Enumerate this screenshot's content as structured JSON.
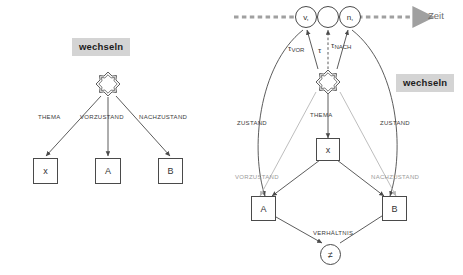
{
  "figure": {
    "title_badges": [
      {
        "id": "left",
        "label": "wechseln"
      },
      {
        "id": "right",
        "label": "wechseln"
      }
    ],
    "timeline": {
      "axis_label": "Zeit",
      "style": "dashed-arrow",
      "color": "#a0a0a0",
      "circles": [
        {
          "id": "vor",
          "label": "v,"
        },
        {
          "id": "mid",
          "label": ""
        },
        {
          "id": "nach",
          "label": "n,"
        }
      ],
      "time_edges": [
        {
          "base": "τ",
          "sub": "VOR"
        },
        {
          "base": "τ",
          "sub": ""
        },
        {
          "base": "τ",
          "sub": "NACH"
        }
      ]
    },
    "left_diagram": {
      "root": {
        "type": "star-node",
        "name": "wechseln"
      },
      "edges": [
        {
          "label": "THEMA",
          "target": "x"
        },
        {
          "label": "VORZUSTAND",
          "target": "A"
        },
        {
          "label": "NACHZUSTAND",
          "target": "B"
        }
      ],
      "nodes": [
        {
          "id": "x",
          "label": "x",
          "shape": "box"
        },
        {
          "id": "A",
          "label": "A",
          "shape": "box"
        },
        {
          "id": "B",
          "label": "B",
          "shape": "box"
        }
      ]
    },
    "right_diagram": {
      "root": {
        "type": "star-node",
        "name": "wechseln"
      },
      "edges": [
        {
          "label": "ZUSTAND",
          "tone": "dark",
          "side": "left"
        },
        {
          "label": "ZUSTAND",
          "tone": "dark",
          "side": "right"
        },
        {
          "label": "THEMA",
          "tone": "dark",
          "side": "center"
        },
        {
          "label": "VORZUSTAND",
          "tone": "grey",
          "side": "left"
        },
        {
          "label": "NACHZUSTAND",
          "tone": "grey",
          "side": "right"
        },
        {
          "label": "VERHÄLTNIS",
          "tone": "dark",
          "side": "bottom"
        }
      ],
      "nodes": [
        {
          "id": "x",
          "label": "x",
          "shape": "box"
        },
        {
          "id": "A",
          "label": "A",
          "shape": "box"
        },
        {
          "id": "B",
          "label": "B",
          "shape": "box"
        },
        {
          "id": "neq",
          "label": "≠",
          "shape": "circle"
        }
      ]
    },
    "colors": {
      "stroke_dark": "#4a4a4a",
      "stroke_grey": "#b5b5b5",
      "text_dark": "#3b3b3b",
      "text_grey": "#9a9a9a",
      "badge_bg": "#d4d4d4"
    }
  }
}
